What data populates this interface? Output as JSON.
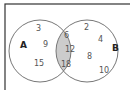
{
  "diagram": {
    "type": "venn",
    "sets": [
      {
        "label": "A",
        "only": [
          "3",
          "9",
          "15"
        ]
      },
      {
        "label": "B",
        "only": [
          "2",
          "4",
          "8",
          "10"
        ]
      }
    ],
    "intersection": [
      "6",
      "12",
      "18"
    ],
    "colors": {
      "border": "#333333",
      "circle_stroke": "#777777",
      "intersection_fill": "#cccccc",
      "text": "#555555"
    }
  }
}
